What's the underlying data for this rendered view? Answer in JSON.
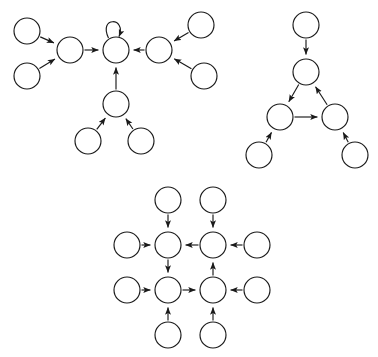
{
  "figure": {
    "background_color": "#ffffff",
    "stroke_color": "#1a1a1a",
    "node_fill": "#ffffff",
    "node_radius": 13,
    "stroke_width": 1.15,
    "width": 378,
    "height": 357
  },
  "graphs": [
    {
      "id": "graph-star-hub",
      "name": "top-left-graph",
      "description": "Central hub with self-loop fed by left, right and bottom sub-hubs",
      "nodes": [
        {
          "id": "g1n1",
          "label": "",
          "cx": 27,
          "cy": 31,
          "role": "leaf"
        },
        {
          "id": "g1n2",
          "label": "",
          "cx": 27,
          "cy": 76,
          "role": "leaf"
        },
        {
          "id": "g1n3",
          "label": "",
          "cx": 70,
          "cy": 50,
          "role": "hub-left"
        },
        {
          "id": "g1n4",
          "label": "",
          "cx": 116,
          "cy": 50,
          "role": "center"
        },
        {
          "id": "g1n5",
          "label": "",
          "cx": 159,
          "cy": 50,
          "role": "hub-right"
        },
        {
          "id": "g1n6",
          "label": "",
          "cx": 201,
          "cy": 25,
          "role": "leaf"
        },
        {
          "id": "g1n7",
          "label": "",
          "cx": 204,
          "cy": 76,
          "role": "leaf"
        },
        {
          "id": "g1n8",
          "label": "",
          "cx": 116,
          "cy": 104,
          "role": "hub-bottom"
        },
        {
          "id": "g1n9",
          "label": "",
          "cx": 88,
          "cy": 141,
          "role": "leaf"
        },
        {
          "id": "g1n10",
          "label": "",
          "cx": 141,
          "cy": 141,
          "role": "leaf"
        }
      ],
      "edges": [
        {
          "from": "g1n1",
          "to": "g1n3",
          "directed": true
        },
        {
          "from": "g1n2",
          "to": "g1n3",
          "directed": true
        },
        {
          "from": "g1n3",
          "to": "g1n4",
          "directed": true
        },
        {
          "from": "g1n5",
          "to": "g1n4",
          "directed": true
        },
        {
          "from": "g1n6",
          "to": "g1n5",
          "directed": true
        },
        {
          "from": "g1n7",
          "to": "g1n5",
          "directed": true
        },
        {
          "from": "g1n8",
          "to": "g1n4",
          "directed": true
        },
        {
          "from": "g1n9",
          "to": "g1n8",
          "directed": true
        },
        {
          "from": "g1n10",
          "to": "g1n8",
          "directed": true
        },
        {
          "from": "g1n4",
          "to": "g1n4",
          "directed": true,
          "self_loop": true
        }
      ]
    },
    {
      "id": "graph-triangle-cycle",
      "name": "top-right-graph",
      "description": "Three-node directed cycle with one input above and two inputs below",
      "nodes": [
        {
          "id": "g2n1",
          "label": "",
          "cx": 306,
          "cy": 25,
          "role": "leaf"
        },
        {
          "id": "g2n2",
          "label": "",
          "cx": 306,
          "cy": 72,
          "role": "cycle-top"
        },
        {
          "id": "g2n3",
          "label": "",
          "cx": 280,
          "cy": 117,
          "role": "cycle-left"
        },
        {
          "id": "g2n4",
          "label": "",
          "cx": 335,
          "cy": 117,
          "role": "cycle-right"
        },
        {
          "id": "g2n5",
          "label": "",
          "cx": 259,
          "cy": 155,
          "role": "leaf"
        },
        {
          "id": "g2n6",
          "label": "",
          "cx": 355,
          "cy": 155,
          "role": "leaf"
        }
      ],
      "edges": [
        {
          "from": "g2n1",
          "to": "g2n2",
          "directed": true
        },
        {
          "from": "g2n2",
          "to": "g2n3",
          "directed": true
        },
        {
          "from": "g2n3",
          "to": "g2n4",
          "directed": true
        },
        {
          "from": "g2n4",
          "to": "g2n2",
          "directed": true
        },
        {
          "from": "g2n5",
          "to": "g2n3",
          "directed": true
        },
        {
          "from": "g2n6",
          "to": "g2n4",
          "directed": true
        }
      ]
    },
    {
      "id": "graph-grid-cycle",
      "name": "bottom-graph",
      "description": "Two-by-two core of nodes forming a counter-clockwise cycle, each fed by two peripheral leaf nodes",
      "nodes": [
        {
          "id": "g3n1",
          "label": "",
          "cx": 168,
          "cy": 200,
          "role": "leaf-top-left"
        },
        {
          "id": "g3n2",
          "label": "",
          "cx": 213,
          "cy": 200,
          "role": "leaf-top-right"
        },
        {
          "id": "g3n3",
          "label": "",
          "cx": 127,
          "cy": 245,
          "role": "leaf-left-upper"
        },
        {
          "id": "g3n4",
          "label": "",
          "cx": 168,
          "cy": 245,
          "role": "core-top-left"
        },
        {
          "id": "g3n5",
          "label": "",
          "cx": 213,
          "cy": 245,
          "role": "core-top-right"
        },
        {
          "id": "g3n6",
          "label": "",
          "cx": 257,
          "cy": 245,
          "role": "leaf-right-upper"
        },
        {
          "id": "g3n7",
          "label": "",
          "cx": 127,
          "cy": 290,
          "role": "leaf-left-lower"
        },
        {
          "id": "g3n8",
          "label": "",
          "cx": 168,
          "cy": 290,
          "role": "core-bottom-left"
        },
        {
          "id": "g3n9",
          "label": "",
          "cx": 213,
          "cy": 290,
          "role": "core-bottom-right"
        },
        {
          "id": "g3n10",
          "label": "",
          "cx": 257,
          "cy": 290,
          "role": "leaf-right-lower"
        },
        {
          "id": "g3n11",
          "label": "",
          "cx": 168,
          "cy": 335,
          "role": "leaf-bottom-left"
        },
        {
          "id": "g3n12",
          "label": "",
          "cx": 213,
          "cy": 335,
          "role": "leaf-bottom-right"
        }
      ],
      "edges": [
        {
          "from": "g3n1",
          "to": "g3n4",
          "directed": true
        },
        {
          "from": "g3n2",
          "to": "g3n5",
          "directed": true
        },
        {
          "from": "g3n3",
          "to": "g3n4",
          "directed": true
        },
        {
          "from": "g3n6",
          "to": "g3n5",
          "directed": true
        },
        {
          "from": "g3n7",
          "to": "g3n8",
          "directed": true
        },
        {
          "from": "g3n10",
          "to": "g3n9",
          "directed": true
        },
        {
          "from": "g3n11",
          "to": "g3n8",
          "directed": true
        },
        {
          "from": "g3n12",
          "to": "g3n9",
          "directed": true
        },
        {
          "from": "g3n5",
          "to": "g3n4",
          "directed": true
        },
        {
          "from": "g3n4",
          "to": "g3n8",
          "directed": true
        },
        {
          "from": "g3n8",
          "to": "g3n9",
          "directed": true
        },
        {
          "from": "g3n9",
          "to": "g3n5",
          "directed": true
        }
      ]
    }
  ]
}
